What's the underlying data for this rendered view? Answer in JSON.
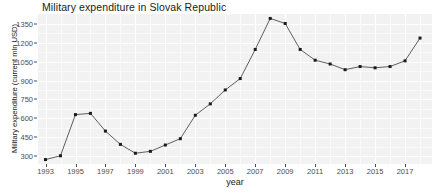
{
  "chart_data": {
    "type": "line",
    "title": "Military expenditure in Slovak Republic",
    "xlabel": "year",
    "ylabel": "Military expenditure (current mln USD)",
    "x": [
      1993,
      1994,
      1995,
      1996,
      1997,
      1998,
      1999,
      2000,
      2001,
      2002,
      2003,
      2004,
      2005,
      2006,
      2007,
      2008,
      2009,
      2010,
      2011,
      2012,
      2013,
      2014,
      2015,
      2016,
      2017,
      2018
    ],
    "values": [
      275,
      305,
      630,
      640,
      500,
      395,
      325,
      340,
      390,
      440,
      625,
      715,
      825,
      915,
      1145,
      1390,
      1350,
      1145,
      1060,
      1030,
      985,
      1010,
      1000,
      1010,
      1055,
      1235
    ],
    "series": [
      {
        "name": "Military expenditure (current mln USD)",
        "values": [
          275,
          305,
          630,
          640,
          500,
          395,
          325,
          340,
          390,
          440,
          625,
          715,
          825,
          915,
          1145,
          1390,
          1350,
          1145,
          1060,
          1030,
          985,
          1010,
          1000,
          1010,
          1055,
          1235
        ]
      }
    ],
    "xlim": [
      1992.5,
      2018.8
    ],
    "ylim": [
      240,
      1425
    ],
    "xticks": [
      1993,
      1995,
      1997,
      1999,
      2001,
      2003,
      2005,
      2007,
      2009,
      2011,
      2013,
      2015,
      2017
    ],
    "xtick_labels": [
      "1993",
      "1995",
      "1997",
      "1999",
      "2001",
      "2003",
      "2005",
      "2007",
      "2009",
      "2011",
      "2013",
      "2015",
      "2017"
    ],
    "yticks": [
      300,
      450,
      600,
      750,
      900,
      1050,
      1200,
      1350
    ],
    "ytick_labels": [
      "300",
      "450",
      "600",
      "750",
      "900",
      "1050",
      "1200",
      "1350"
    ],
    "grid": true,
    "legend": "none",
    "line_color": "#4d4d4d",
    "marker_color": "#1a1a1a",
    "panel_color": "#f2f2f2",
    "grid_color": "#ffffff"
  }
}
